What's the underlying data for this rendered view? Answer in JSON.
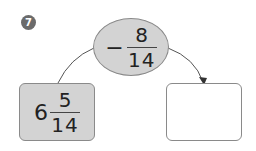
{
  "problem": {
    "number": "7"
  },
  "operation": {
    "operator": "−",
    "numerator": "8",
    "denominator": "14"
  },
  "start_value": {
    "whole": "6",
    "numerator": "5",
    "denominator": "14"
  },
  "answer_box": {
    "value": ""
  },
  "colors": {
    "shape_fill": "#d3d3d3",
    "badge_fill": "#6b6b6b",
    "stroke": "#8a8a8a"
  }
}
